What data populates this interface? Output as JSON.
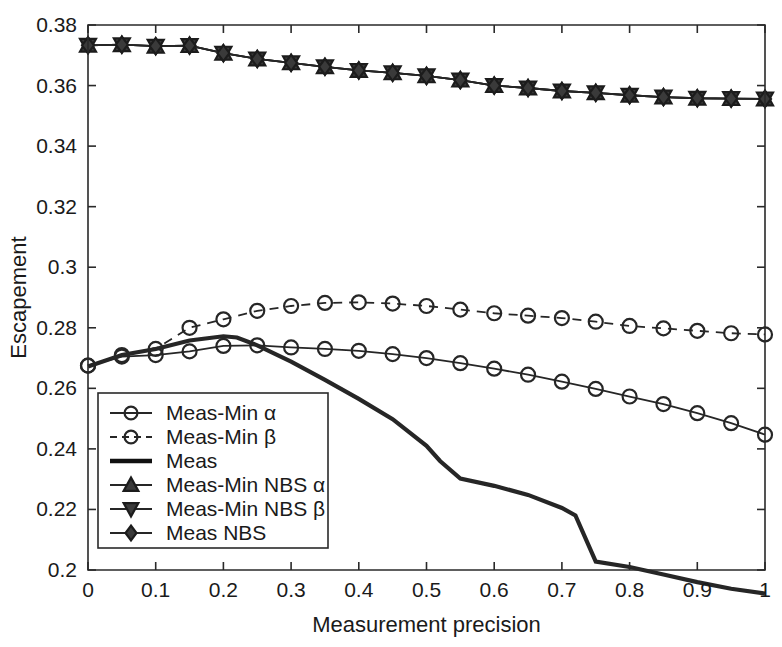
{
  "chart_data": {
    "type": "line",
    "title": "",
    "xlabel": "Measurement precision",
    "ylabel": "Escapement",
    "xlim": [
      0,
      1
    ],
    "ylim": [
      0.2,
      0.38
    ],
    "xticks": [
      0,
      0.1,
      0.2,
      0.3,
      0.4,
      0.5,
      0.6,
      0.7,
      0.8,
      0.9,
      1
    ],
    "xticklabels": [
      "0",
      "0.1",
      "0.2",
      "0.3",
      "0.4",
      "0.5",
      "0.6",
      "0.7",
      "0.8",
      "0.9",
      "1"
    ],
    "yticks": [
      0.2,
      0.22,
      0.24,
      0.26,
      0.28,
      0.3,
      0.32,
      0.34,
      0.36,
      0.38
    ],
    "yticklabels": [
      "0.2",
      "0.22",
      "0.24",
      "0.26",
      "0.28",
      "0.3",
      "0.32",
      "0.34",
      "0.36",
      "0.38"
    ],
    "grid": false,
    "legend_position": "lower-left",
    "series": [
      {
        "name": "Meas-Min α",
        "marker": "circle",
        "linestyle": "solid",
        "color": "#262626",
        "x": [
          0,
          0.05,
          0.1,
          0.15,
          0.2,
          0.25,
          0.3,
          0.35,
          0.4,
          0.45,
          0.5,
          0.55,
          0.6,
          0.65,
          0.7,
          0.75,
          0.8,
          0.85,
          0.9,
          0.95,
          1
        ],
        "values": [
          0.2675,
          0.2705,
          0.271,
          0.2722,
          0.274,
          0.2742,
          0.2735,
          0.273,
          0.2724,
          0.2713,
          0.27,
          0.2683,
          0.2665,
          0.2645,
          0.2622,
          0.2598,
          0.2573,
          0.2548,
          0.2518,
          0.2485,
          0.2447
        ]
      },
      {
        "name": "Meas-Min β",
        "marker": "circle",
        "linestyle": "dashed",
        "color": "#262626",
        "x": [
          0,
          0.05,
          0.1,
          0.15,
          0.2,
          0.25,
          0.3,
          0.35,
          0.4,
          0.45,
          0.5,
          0.55,
          0.6,
          0.65,
          0.7,
          0.75,
          0.8,
          0.85,
          0.9,
          0.95,
          1
        ],
        "values": [
          0.2675,
          0.271,
          0.273,
          0.28,
          0.2828,
          0.2856,
          0.2872,
          0.2882,
          0.2884,
          0.288,
          0.2872,
          0.286,
          0.2848,
          0.284,
          0.2832,
          0.282,
          0.2806,
          0.2798,
          0.279,
          0.2782,
          0.2778
        ]
      },
      {
        "name": "Meas",
        "marker": "none",
        "linestyle": "solid-thick",
        "color": "#111111",
        "x": [
          0,
          0.05,
          0.1,
          0.15,
          0.2,
          0.22,
          0.25,
          0.3,
          0.35,
          0.4,
          0.45,
          0.5,
          0.52,
          0.55,
          0.6,
          0.65,
          0.7,
          0.72,
          0.75,
          0.8,
          0.85,
          0.9,
          0.95,
          1
        ],
        "values": [
          0.2672,
          0.271,
          0.273,
          0.2758,
          0.2772,
          0.2768,
          0.2742,
          0.2688,
          0.2628,
          0.2565,
          0.2498,
          0.241,
          0.236,
          0.2302,
          0.2278,
          0.2248,
          0.2205,
          0.218,
          0.2028,
          0.201,
          0.1985,
          0.196,
          0.1938,
          0.1922
        ]
      },
      {
        "name": "Meas-Min NBS α",
        "marker": "triangle-up",
        "linestyle": "solid",
        "color": "#262626",
        "x": [
          0,
          0.05,
          0.1,
          0.15,
          0.2,
          0.25,
          0.3,
          0.35,
          0.4,
          0.45,
          0.5,
          0.55,
          0.6,
          0.65,
          0.7,
          0.75,
          0.8,
          0.85,
          0.9,
          0.95,
          1
        ],
        "values": [
          0.3733,
          0.3735,
          0.373,
          0.3732,
          0.3707,
          0.3688,
          0.3675,
          0.3662,
          0.365,
          0.3642,
          0.3632,
          0.3618,
          0.36,
          0.3592,
          0.3582,
          0.3576,
          0.3568,
          0.3562,
          0.3558,
          0.3557,
          0.3556
        ]
      },
      {
        "name": "Meas-Min NBS β",
        "marker": "triangle-down",
        "linestyle": "solid",
        "color": "#262626",
        "x": [
          0,
          0.05,
          0.1,
          0.15,
          0.2,
          0.25,
          0.3,
          0.35,
          0.4,
          0.45,
          0.5,
          0.55,
          0.6,
          0.65,
          0.7,
          0.75,
          0.8,
          0.85,
          0.9,
          0.95,
          1
        ],
        "values": [
          0.3733,
          0.3735,
          0.373,
          0.3732,
          0.3707,
          0.3688,
          0.3675,
          0.3662,
          0.365,
          0.3642,
          0.3632,
          0.3618,
          0.36,
          0.3592,
          0.3582,
          0.3576,
          0.3568,
          0.3562,
          0.3558,
          0.3557,
          0.3556
        ]
      },
      {
        "name": "Meas NBS",
        "marker": "diamond",
        "linestyle": "solid",
        "color": "#262626",
        "x": [
          0,
          0.05,
          0.1,
          0.15,
          0.2,
          0.25,
          0.3,
          0.35,
          0.4,
          0.45,
          0.5,
          0.55,
          0.6,
          0.65,
          0.7,
          0.75,
          0.8,
          0.85,
          0.9,
          0.95,
          1
        ],
        "values": [
          0.3733,
          0.3735,
          0.373,
          0.3732,
          0.3707,
          0.3688,
          0.3675,
          0.3662,
          0.365,
          0.3642,
          0.3632,
          0.3618,
          0.36,
          0.3592,
          0.3582,
          0.3576,
          0.3568,
          0.3562,
          0.3558,
          0.3557,
          0.3556
        ]
      }
    ]
  },
  "legend": {
    "items": [
      {
        "label": "Meas-Min α"
      },
      {
        "label": "Meas-Min β"
      },
      {
        "label": "Meas"
      },
      {
        "label": "Meas-Min NBS α"
      },
      {
        "label": "Meas-Min NBS β"
      },
      {
        "label": "Meas NBS"
      }
    ]
  },
  "colors": {
    "axis": "#2a2a2a",
    "series": "#262626",
    "meas_line": "#111111",
    "background": "#ffffff"
  }
}
